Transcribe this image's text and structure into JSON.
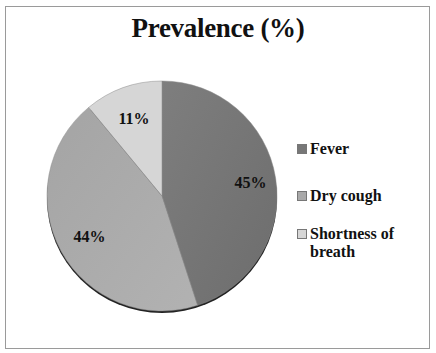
{
  "chart_data": {
    "type": "pie",
    "title": "Prevalence (%)",
    "categories": [
      "Fever",
      "Dry cough",
      "Shortness of breath"
    ],
    "values": [
      45,
      44,
      11
    ],
    "labels": [
      "45%",
      "44%",
      "11%"
    ],
    "colors": [
      "#777777",
      "#a9a9a9",
      "#d6d6d6"
    ],
    "legend_position": "right",
    "start_angle_deg": 0,
    "direction": "clockwise"
  },
  "legend": {
    "items": [
      {
        "label": "Fever",
        "color": "#777777"
      },
      {
        "label": "Dry cough",
        "color": "#a9a9a9"
      },
      {
        "label": "Shortness of breath",
        "color": "#d6d6d6"
      }
    ]
  }
}
